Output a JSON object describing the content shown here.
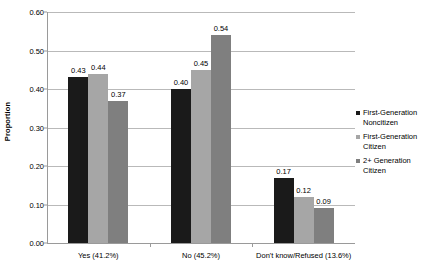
{
  "chart_data": {
    "type": "bar",
    "title": "",
    "subtitle": "",
    "xlabel": "",
    "ylabel": "Proportion",
    "ylim": [
      0.0,
      0.6
    ],
    "ytick_labels": [
      "0.00",
      "0.10",
      "0.20",
      "0.30",
      "0.40",
      "0.50",
      "0.60"
    ],
    "ytick_values": [
      0.0,
      0.1,
      0.2,
      0.3,
      0.4,
      0.5,
      0.6
    ],
    "grid": "horizontal",
    "legend_position": "right",
    "categories": [
      "Yes (41.2%)",
      "No (45.2%)",
      "Don't know/Refused (13.6%)"
    ],
    "series": [
      {
        "name": "First-Generation Noncitizen",
        "color": "#1a1a1a",
        "values": [
          0.43,
          0.4,
          0.17
        ],
        "labels": [
          "0.43",
          "0.40",
          "0.17"
        ]
      },
      {
        "name": "First-Generation Citizen",
        "color": "#a6a6a6",
        "values": [
          0.44,
          0.45,
          0.12
        ],
        "labels": [
          "0.44",
          "0.45",
          "0.12"
        ]
      },
      {
        "name": "2+ Generation Citizen",
        "color": "#7f7f7f",
        "values": [
          0.37,
          0.54,
          0.09
        ],
        "labels": [
          "0.37",
          "0.54",
          "0.09"
        ]
      }
    ]
  },
  "colors": {
    "background": "#ffffff",
    "gridline": "#b9b9b9",
    "axis": "#9a9a9a",
    "text": "#000000"
  }
}
